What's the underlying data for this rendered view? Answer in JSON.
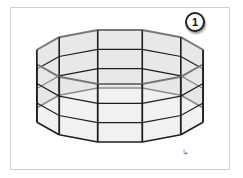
{
  "figure": {
    "step_number": "1",
    "shape": "12-sided open prism wireframe (cylinder approximation)",
    "sides": 12,
    "horizontal_divisions": 3,
    "colors": {
      "edge": "#1e1e1e",
      "face": "#e6e6e6",
      "rim": "#777777",
      "frame": "#cfcfcf"
    }
  },
  "cursor": {
    "icon": "mouse-pointer-icon",
    "glyph": "↘"
  }
}
